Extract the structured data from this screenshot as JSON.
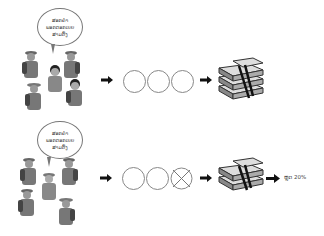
{
  "rows": [
    {
      "id": "full",
      "speech_bubble": {
        "lines": [
          "ສອກຄຳ",
          "ພອກດອກເບຍ",
          "ສາມຕົ້ງ"
        ]
      },
      "people_count": 5,
      "circles": [
        {
          "crossed": false
        },
        {
          "crossed": false
        },
        {
          "crossed": false
        }
      ],
      "money_stacks": 3,
      "result_label": ""
    },
    {
      "id": "reduced",
      "speech_bubble": {
        "lines": [
          "ສອກຄຳ",
          "ພອກດອກເບຍ",
          "ສາມຕົ້ງ"
        ]
      },
      "people_count": 5,
      "circles": [
        {
          "crossed": false
        },
        {
          "crossed": false
        },
        {
          "crossed": true
        }
      ],
      "money_stacks": 2,
      "result_label": "ຫຼຸດ 20%"
    }
  ],
  "icons": {
    "arrow": "right-arrow-icon",
    "money": "money-stack-icon",
    "person": "worker-icon"
  },
  "colors": {
    "line": "#888888",
    "ink": "#222222",
    "background": "#ffffff"
  }
}
